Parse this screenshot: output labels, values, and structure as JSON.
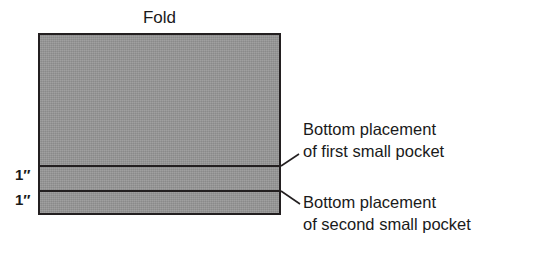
{
  "diagram": {
    "title_label": "Fold",
    "panel": {
      "name": "fabric-panel",
      "fill_color": "#969696",
      "stroke_color": "#231f20"
    },
    "dimensions": [
      {
        "id": "first-gap",
        "label": "1″"
      },
      {
        "id": "second-gap",
        "label": "1″"
      }
    ],
    "callouts": [
      {
        "id": "first-pocket",
        "line1": "Bottom placement",
        "line2": "of first small pocket",
        "text": "Bottom placement\nof first small pocket"
      },
      {
        "id": "second-pocket",
        "line1": "Bottom placement",
        "line2": "of second small pocket",
        "text": "Bottom placement\nof second small pocket"
      }
    ],
    "placement_lines": [
      {
        "id": "first-placement-line",
        "stroke_color": "#231f20"
      },
      {
        "id": "second-placement-line",
        "stroke_color": "#231f20"
      }
    ],
    "background_color": "#ffffff"
  }
}
